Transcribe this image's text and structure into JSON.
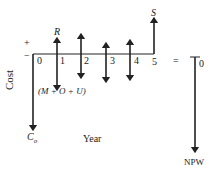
{
  "diagram": {
    "axis_label_y": "Cost",
    "axis_label_x": "Year",
    "plus_sign": "+",
    "minus_sign": "−",
    "years": [
      "0",
      "1",
      "2",
      "3",
      "4",
      "5"
    ],
    "revenue_label": "R",
    "salvage_label": "S",
    "initial_cost_label": "C",
    "initial_cost_subscript": "o",
    "annual_cost_label": "(M + O + U)",
    "equals_sign": "=",
    "npw_zero_label": "0",
    "npw_label": "NPW",
    "line_color": "#222222"
  }
}
